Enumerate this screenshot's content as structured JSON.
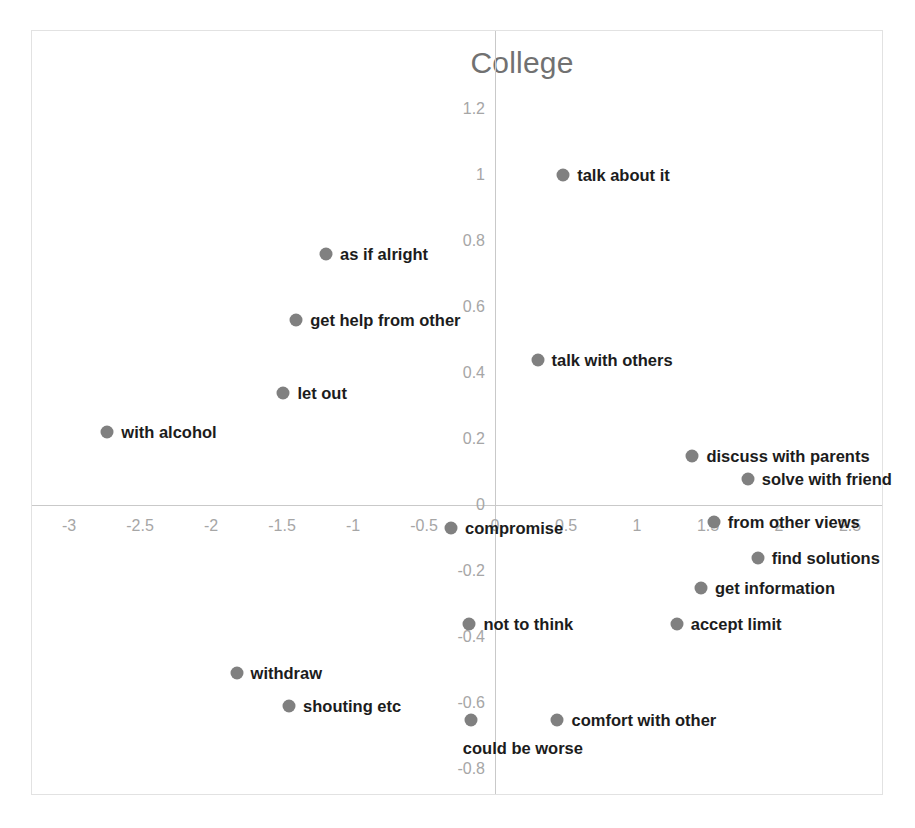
{
  "chart_data": {
    "type": "scatter",
    "title": "College",
    "xlabel": "",
    "ylabel": "",
    "xlim": [
      -3.25,
      2.75
    ],
    "ylim": [
      -0.8,
      1.2
    ],
    "grid": false,
    "legend": "none",
    "xticks": [
      "-3",
      "-2.5",
      "-2",
      "-1.5",
      "-1",
      "-0.5",
      "0",
      "0.5",
      "1",
      "1.5",
      "2",
      "2.5"
    ],
    "xtick_values": [
      -3,
      -2.5,
      -2,
      -1.5,
      -1,
      -0.5,
      0,
      0.5,
      1,
      1.5,
      2,
      2.5
    ],
    "yticks": [
      "1.2",
      "1",
      "0.8",
      "0.6",
      "0.4",
      "0.2",
      "0",
      "-0.2",
      "-0.4",
      "-0.6",
      "-0.8"
    ],
    "ytick_values": [
      1.2,
      1,
      0.8,
      0.6,
      0.4,
      0.2,
      0,
      -0.2,
      -0.4,
      -0.6,
      -0.8
    ],
    "marker_color": "#808080",
    "axis_color": "#c9c9c9",
    "tick_color": "#a6a6a6",
    "label_color": "#1c1c1c",
    "title_color": "#717171",
    "points": [
      {
        "label": "talk about it",
        "x": 0.48,
        "y": 1.0,
        "side": "right"
      },
      {
        "label": "as if alright",
        "x": -1.19,
        "y": 0.76,
        "side": "right"
      },
      {
        "label": "get help from other",
        "x": -1.4,
        "y": 0.56,
        "side": "right"
      },
      {
        "label": "talk with others",
        "x": 0.3,
        "y": 0.44,
        "side": "right"
      },
      {
        "label": "let out",
        "x": -1.49,
        "y": 0.34,
        "side": "right"
      },
      {
        "label": "with alcohol",
        "x": -2.73,
        "y": 0.22,
        "side": "right"
      },
      {
        "label": "discuss with parents",
        "x": 1.39,
        "y": 0.15,
        "side": "right"
      },
      {
        "label": "solve with friend",
        "x": 1.78,
        "y": 0.08,
        "side": "right"
      },
      {
        "label": "compromise",
        "x": -0.31,
        "y": -0.07,
        "side": "right"
      },
      {
        "label": "from other views",
        "x": 1.54,
        "y": -0.05,
        "side": "right"
      },
      {
        "label": "find solutions",
        "x": 1.85,
        "y": -0.16,
        "side": "right"
      },
      {
        "label": "get information",
        "x": 1.45,
        "y": -0.25,
        "side": "right"
      },
      {
        "label": "not to think",
        "x": -0.18,
        "y": -0.36,
        "side": "right"
      },
      {
        "label": "accept limit",
        "x": 1.28,
        "y": -0.36,
        "side": "right"
      },
      {
        "label": "withdraw",
        "x": -1.82,
        "y": -0.51,
        "side": "right"
      },
      {
        "label": "shouting etc",
        "x": -1.45,
        "y": -0.61,
        "side": "right"
      },
      {
        "label": "could be worse",
        "x": -0.17,
        "y": -0.65,
        "side": "below"
      },
      {
        "label": "comfort with other",
        "x": 0.44,
        "y": -0.65,
        "side": "right"
      }
    ]
  },
  "caption": {
    "text": ""
  }
}
